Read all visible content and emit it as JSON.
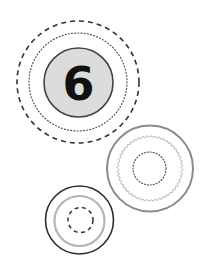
{
  "badge": {
    "label": "6",
    "fill": "#dcdcdc",
    "stroke": "#444444"
  },
  "groups": [
    {
      "name": "number-badge-group",
      "center": [
        78,
        82
      ],
      "rings": [
        {
          "style": "dashed",
          "radius": 61,
          "color": "#333333"
        },
        {
          "style": "dotted",
          "radius": 49,
          "color": "#555555"
        },
        {
          "style": "solid-filled",
          "radius": 35,
          "color": "#444444",
          "fill": "#dcdcdc"
        }
      ]
    },
    {
      "name": "grey-ring-group",
      "center": [
        150,
        168
      ],
      "rings": [
        {
          "style": "solid",
          "radius": 43,
          "color": "#8a8a8a"
        },
        {
          "style": "wavy",
          "radius": 32,
          "color": "#a0a0a0"
        },
        {
          "style": "dotted",
          "radius": 16.5,
          "color": "#555555"
        }
      ]
    },
    {
      "name": "dark-ring-group",
      "center": [
        80,
        220
      ],
      "rings": [
        {
          "style": "solid",
          "radius": 34,
          "color": "#2e2e2e"
        },
        {
          "style": "solid",
          "radius": 25,
          "color": "#b4b4b4"
        },
        {
          "style": "dashed",
          "radius": 12.5,
          "color": "#333333"
        }
      ]
    }
  ]
}
